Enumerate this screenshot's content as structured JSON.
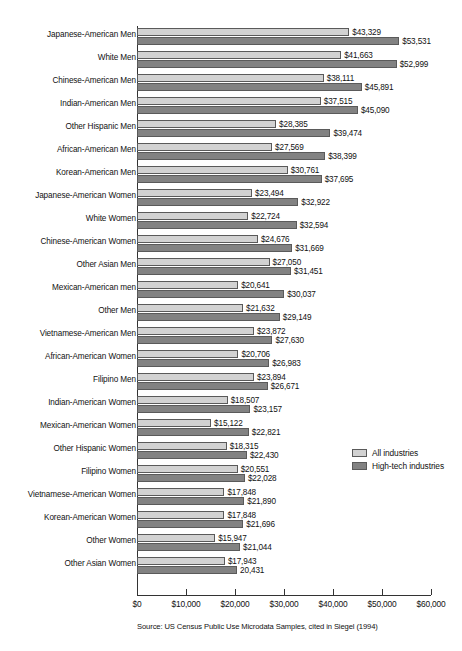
{
  "chart_data": {
    "type": "bar",
    "orientation": "horizontal",
    "title": "",
    "xlabel": "",
    "ylabel": "",
    "xlim": [
      0,
      60000
    ],
    "xticks": [
      0,
      10000,
      20000,
      30000,
      40000,
      50000,
      60000
    ],
    "xtick_labels": [
      "$0",
      "$10,000",
      "$20,000",
      "$30,000",
      "$40,000",
      "$50,000",
      "$60,000"
    ],
    "grid": false,
    "legend_position": "right-middle",
    "source": "Source: US Census Public Use Microdata Samples, cited in Siegel (1994)",
    "categories": [
      "Japanese-American Men",
      "White Men",
      "Chinese-American Men",
      "Indian-American Men",
      "Other Hispanic Men",
      "African-American Men",
      "Korean-American Men",
      "Japanese-American Women",
      "White Women",
      "Chinese-American Women",
      "Other Asian Men",
      "Mexican-American men",
      "Other Men",
      "Vietnamese-American Men",
      "African-American Women",
      "Filipino Men",
      "Indian-American Women",
      "Mexican-American Women",
      "Other Hispanic Women",
      "Filipino Women",
      "Vietnamese-American Women",
      "Korean-American Women",
      "Other Women",
      "Other Asian Women"
    ],
    "series": [
      {
        "name": "All industries",
        "color": "#d2d2d2",
        "values": [
          43329,
          41663,
          38111,
          37515,
          28385,
          27569,
          30761,
          23494,
          22724,
          24676,
          27050,
          20641,
          21632,
          23872,
          20706,
          23894,
          18507,
          15122,
          18315,
          20551,
          17848,
          17848,
          15947,
          17943
        ],
        "labels": [
          "$43,329",
          "$41,663",
          "$38,111",
          "$37,515",
          "$28,385",
          "$27,569",
          "$30,761",
          "$23,494",
          "$22,724",
          "$24,676",
          "$27,050",
          "$20,641",
          "$21,632",
          "$23,872",
          "$20,706",
          "$23,894",
          "$18,507",
          "$15,122",
          "$18,315",
          "$20,551",
          "$17,848",
          "$17,848",
          "$15,947",
          "$17,943"
        ]
      },
      {
        "name": "High-tech industries",
        "color": "#828282",
        "values": [
          53531,
          52999,
          45891,
          45090,
          39474,
          38399,
          37695,
          32922,
          32594,
          31669,
          31451,
          30037,
          29149,
          27630,
          26983,
          26671,
          23157,
          22821,
          22430,
          22028,
          21890,
          21696,
          21044,
          20431
        ],
        "labels": [
          "$53,531",
          "$52,999",
          "$45,891",
          "$45,090",
          "$39,474",
          "$38,399",
          "$37,695",
          "$32,922",
          "$32,594",
          "$31,669",
          "$31,451",
          "$30,037",
          "$29,149",
          "$27,630",
          "$26,983",
          "$26,671",
          "$23,157",
          "$22,821",
          "$22,430",
          "$22,028",
          "$21,890",
          "$21,696",
          "$21,044",
          "20,431"
        ]
      }
    ]
  },
  "legend": {
    "items": [
      {
        "label": "All industries",
        "swatch": "light"
      },
      {
        "label": "High-tech industries",
        "swatch": "dark"
      }
    ]
  },
  "source_note": "Source: US Census Public Use Microdata Samples, cited in Siegel (1994)"
}
